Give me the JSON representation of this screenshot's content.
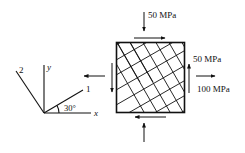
{
  "figure": {
    "type": "stress element with fiber axes",
    "colors": {
      "ink": "#111111",
      "background": "#ffffff"
    }
  },
  "axes": {
    "x_label": "x",
    "y_label": "y",
    "axis1_label": "1",
    "axis2_label": "2",
    "angle_label": "30°",
    "angle_deg": 30
  },
  "loads": {
    "top_normal": {
      "label": "50 MPa",
      "direction": "compressive (down onto top face)"
    },
    "shear": {
      "label": "50 MPa",
      "direction": "top face right, right face up, bottom face left, left face down"
    },
    "right_normal": {
      "label": "100 MPa",
      "direction": "tensile (right face pulled right)"
    }
  },
  "element": {
    "shape": "square",
    "hatching": "fibers at 30° and 120° (directions 1 and 2)"
  }
}
